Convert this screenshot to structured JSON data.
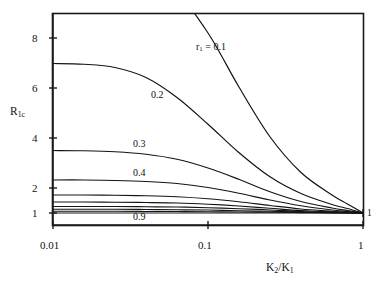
{
  "chart_data": {
    "type": "line",
    "title": "",
    "subtitle": "",
    "xlabel": "K2/K1",
    "xlabel_rich": "K₂/K₁",
    "ylabel": "R1c",
    "ylabel_rich": "R₁c",
    "xscale": "log",
    "yscale": "linear",
    "xlim": [
      0.01,
      1
    ],
    "ylim": [
      0.72,
      9.25
    ],
    "grid": false,
    "legend": "inline-curve-labels",
    "xticks": [
      0.01,
      0.1,
      1
    ],
    "xtick_labels": [
      "0.01",
      "0.1",
      "1"
    ],
    "yticks": [
      1,
      2,
      4,
      6,
      8
    ],
    "ytick_labels": [
      "1",
      "2",
      "4",
      "6",
      "8"
    ],
    "annotations": [
      {
        "text": "r₁ = 0.1",
        "plain": "r1 = 0.1",
        "x": 0.115,
        "y": 8.15
      },
      {
        "text": "0.2",
        "plain": "0.2",
        "x": 0.0345,
        "y": 5.62
      },
      {
        "text": "0.3",
        "plain": "0.3",
        "x": 0.0295,
        "y": 3.82
      },
      {
        "text": "0.4",
        "plain": "0.4",
        "x": 0.0295,
        "y": 2.68
      },
      {
        "text": "0.9",
        "plain": "0.9",
        "x": 0.0295,
        "y": 0.86
      },
      {
        "text": "1",
        "plain": "1",
        "x": 1.08,
        "y": 1.0
      }
    ],
    "series": [
      {
        "name": "r1 = 0.1",
        "r1": 0.1,
        "label": "r₁ = 0.1",
        "x": [
          0.01,
          0.0158,
          0.0251,
          0.0398,
          0.0631,
          0.1,
          0.158,
          0.251,
          0.398,
          0.631,
          0.794,
          1.0
        ],
        "y": [
          10.0,
          10.0,
          10.0,
          10.0,
          9.75,
          8.2,
          6.05,
          4.05,
          2.62,
          1.72,
          1.36,
          1.0
        ]
      },
      {
        "name": "0.2",
        "r1": 0.2,
        "label": "0.2",
        "x": [
          0.01,
          0.0158,
          0.0251,
          0.0398,
          0.0631,
          0.1,
          0.158,
          0.251,
          0.398,
          0.631,
          0.794,
          1.0
        ],
        "y": [
          6.98,
          6.95,
          6.82,
          6.42,
          5.62,
          4.55,
          3.42,
          2.45,
          1.78,
          1.34,
          1.18,
          1.0
        ]
      },
      {
        "name": "0.3",
        "r1": 0.3,
        "label": "0.3",
        "x": [
          0.01,
          0.0158,
          0.0251,
          0.0398,
          0.0631,
          0.1,
          0.158,
          0.251,
          0.398,
          0.631,
          0.794,
          1.0
        ],
        "y": [
          3.5,
          3.49,
          3.45,
          3.35,
          3.15,
          2.8,
          2.35,
          1.85,
          1.46,
          1.2,
          1.1,
          1.0
        ]
      },
      {
        "name": "0.4",
        "r1": 0.4,
        "label": "0.4",
        "x": [
          0.01,
          0.0158,
          0.0251,
          0.0398,
          0.0631,
          0.1,
          0.158,
          0.251,
          0.398,
          0.631,
          0.794,
          1.0
        ],
        "y": [
          2.32,
          2.32,
          2.3,
          2.26,
          2.18,
          2.02,
          1.79,
          1.52,
          1.29,
          1.12,
          1.06,
          1.0
        ]
      },
      {
        "name": "0.5",
        "r1": 0.5,
        "label": "0.5",
        "x": [
          0.01,
          0.0158,
          0.0251,
          0.0398,
          0.0631,
          0.1,
          0.158,
          0.251,
          0.398,
          0.631,
          0.794,
          1.0
        ],
        "y": [
          1.72,
          1.72,
          1.71,
          1.69,
          1.65,
          1.57,
          1.45,
          1.3,
          1.16,
          1.07,
          1.03,
          1.0
        ]
      },
      {
        "name": "0.6",
        "r1": 0.6,
        "label": "0.6",
        "x": [
          0.01,
          0.0158,
          0.0251,
          0.0398,
          0.0631,
          0.1,
          0.158,
          0.251,
          0.398,
          0.631,
          0.794,
          1.0
        ],
        "y": [
          1.44,
          1.44,
          1.43,
          1.42,
          1.4,
          1.35,
          1.28,
          1.19,
          1.1,
          1.04,
          1.02,
          1.0
        ]
      },
      {
        "name": "0.7",
        "r1": 0.7,
        "label": "0.7",
        "x": [
          0.01,
          0.0158,
          0.0251,
          0.0398,
          0.0631,
          0.1,
          0.158,
          0.251,
          0.398,
          0.631,
          0.794,
          1.0
        ],
        "y": [
          1.26,
          1.26,
          1.26,
          1.25,
          1.24,
          1.21,
          1.17,
          1.12,
          1.06,
          1.025,
          1.012,
          1.0
        ]
      },
      {
        "name": "0.8",
        "r1": 0.8,
        "label": "0.8",
        "x": [
          0.01,
          0.0158,
          0.0251,
          0.0398,
          0.0631,
          0.1,
          0.158,
          0.251,
          0.398,
          0.631,
          0.794,
          1.0
        ],
        "y": [
          1.15,
          1.15,
          1.15,
          1.14,
          1.13,
          1.12,
          1.09,
          1.07,
          1.04,
          1.015,
          1.007,
          1.0
        ]
      },
      {
        "name": "0.9",
        "r1": 0.9,
        "label": "0.9",
        "x": [
          0.01,
          0.0158,
          0.0251,
          0.0398,
          0.0631,
          0.1,
          0.158,
          0.251,
          0.398,
          0.631,
          0.794,
          1.0
        ],
        "y": [
          1.07,
          1.07,
          1.07,
          1.06,
          1.06,
          1.05,
          1.04,
          1.03,
          1.018,
          1.007,
          1.003,
          1.0
        ]
      }
    ]
  },
  "axes": {
    "y_title_main": "R",
    "y_title_sub": "1c",
    "x_title_k2": "K",
    "x_title_k2_sub": "2",
    "x_title_slash": "/K",
    "x_title_k1_sub": "1",
    "ytick_8": "8",
    "ytick_6": "6",
    "ytick_4": "4",
    "ytick_2": "2",
    "ytick_1": "1",
    "xtick_001": "0.01",
    "xtick_01": "0.1",
    "xtick_1": "1"
  },
  "labels": {
    "r1_prefix": "r",
    "r1_sub": "1",
    "r1_value": " = 0.1",
    "c02": "0.2",
    "c03": "0.3",
    "c04": "0.4",
    "c09": "0.9",
    "right_edge_one": "1"
  },
  "style": {
    "line_color": "#141414",
    "axis_color": "#1a1a1a",
    "background": "#ffffff"
  }
}
